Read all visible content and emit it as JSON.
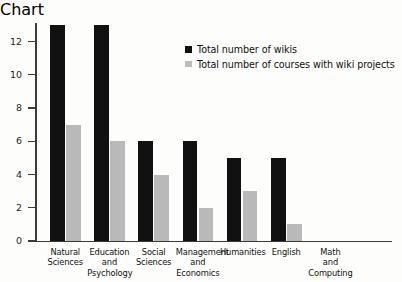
{
  "chart_data": {
    "type": "bar",
    "title": "",
    "xlabel": "",
    "ylabel": "",
    "ylim": [
      0,
      13
    ],
    "yticks": [
      0,
      2,
      4,
      6,
      8,
      10,
      12
    ],
    "grid": false,
    "legend_position": "top-right",
    "categories": [
      "Natural\nSciences",
      "Education\nand\nPsychology",
      "Social\nSciences",
      "Management\nand\nEconomics",
      "Humanities",
      "English",
      "Math\nand\nComputing"
    ],
    "series": [
      {
        "name": "Total number of wikis",
        "color": "#111111",
        "values": [
          13,
          13,
          6,
          6,
          5,
          5,
          0
        ]
      },
      {
        "name": "Total number of courses with wiki projects",
        "color": "#b9b9b9",
        "values": [
          7,
          6,
          4,
          2,
          3,
          1,
          0
        ]
      }
    ]
  },
  "legend": {
    "items": [
      {
        "label": "Total number of wikis",
        "swatch": "#111111"
      },
      {
        "label": "Total number of courses with wiki projects",
        "swatch": "#b9b9b9"
      }
    ]
  }
}
